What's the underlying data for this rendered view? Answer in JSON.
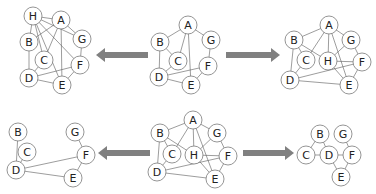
{
  "style": {
    "node_stroke": "#7a7a7a",
    "node_fill": "#ffffff",
    "edge_stroke": "#5a5a5a",
    "label_color": "#222222",
    "arrow_color": "#808080",
    "node_radius": 9
  },
  "graphs": [
    {
      "id": "top-left",
      "name": "graph-with-h-combined",
      "nodes": [
        {
          "id": "H",
          "label": "H",
          "x": 33,
          "y": 16
        },
        {
          "id": "A",
          "label": "A",
          "x": 61,
          "y": 20
        },
        {
          "id": "G",
          "label": "G",
          "x": 82,
          "y": 39
        },
        {
          "id": "B",
          "label": "B",
          "x": 29,
          "y": 42
        },
        {
          "id": "C",
          "label": "C",
          "x": 44,
          "y": 60
        },
        {
          "id": "F",
          "label": "F",
          "x": 80,
          "y": 65
        },
        {
          "id": "D",
          "label": "D",
          "x": 29,
          "y": 78
        },
        {
          "id": "E",
          "label": "E",
          "x": 62,
          "y": 85
        }
      ],
      "edges": [
        [
          "H",
          "A"
        ],
        [
          "H",
          "B"
        ],
        [
          "H",
          "G"
        ],
        [
          "H",
          "C"
        ],
        [
          "H",
          "F"
        ],
        [
          "H",
          "E"
        ],
        [
          "A",
          "G"
        ],
        [
          "A",
          "B"
        ],
        [
          "A",
          "C"
        ],
        [
          "A",
          "E"
        ],
        [
          "G",
          "F"
        ],
        [
          "B",
          "D"
        ],
        [
          "C",
          "D"
        ],
        [
          "D",
          "F"
        ],
        [
          "D",
          "E"
        ],
        [
          "F",
          "E"
        ]
      ]
    },
    {
      "id": "top-center",
      "name": "original-graph",
      "nodes": [
        {
          "id": "A",
          "label": "A",
          "x": 188,
          "y": 25
        },
        {
          "id": "G",
          "label": "G",
          "x": 211,
          "y": 40
        },
        {
          "id": "B",
          "label": "B",
          "x": 160,
          "y": 42
        },
        {
          "id": "C",
          "label": "C",
          "x": 178,
          "y": 61
        },
        {
          "id": "F",
          "label": "F",
          "x": 208,
          "y": 66
        },
        {
          "id": "D",
          "label": "D",
          "x": 159,
          "y": 77
        },
        {
          "id": "E",
          "label": "E",
          "x": 191,
          "y": 85
        }
      ],
      "edges": [
        [
          "A",
          "B"
        ],
        [
          "A",
          "G"
        ],
        [
          "A",
          "C"
        ],
        [
          "A",
          "E"
        ],
        [
          "B",
          "C"
        ],
        [
          "B",
          "D"
        ],
        [
          "C",
          "D"
        ],
        [
          "G",
          "F"
        ],
        [
          "F",
          "D"
        ],
        [
          "F",
          "E"
        ],
        [
          "D",
          "E"
        ]
      ]
    },
    {
      "id": "top-right",
      "name": "graph-with-h-added",
      "nodes": [
        {
          "id": "A",
          "label": "A",
          "x": 329,
          "y": 25
        },
        {
          "id": "B",
          "label": "B",
          "x": 294,
          "y": 40
        },
        {
          "id": "G",
          "label": "G",
          "x": 351,
          "y": 40
        },
        {
          "id": "C",
          "label": "C",
          "x": 306,
          "y": 60
        },
        {
          "id": "H",
          "label": "H",
          "x": 328,
          "y": 61
        },
        {
          "id": "F",
          "label": "F",
          "x": 362,
          "y": 62
        },
        {
          "id": "D",
          "label": "D",
          "x": 290,
          "y": 80
        },
        {
          "id": "E",
          "label": "E",
          "x": 349,
          "y": 85
        }
      ],
      "edges": [
        [
          "A",
          "B"
        ],
        [
          "A",
          "G"
        ],
        [
          "A",
          "C"
        ],
        [
          "A",
          "H"
        ],
        [
          "A",
          "E"
        ],
        [
          "B",
          "H"
        ],
        [
          "B",
          "C"
        ],
        [
          "B",
          "D"
        ],
        [
          "C",
          "D"
        ],
        [
          "G",
          "H"
        ],
        [
          "G",
          "F"
        ],
        [
          "H",
          "F"
        ],
        [
          "H",
          "E"
        ],
        [
          "F",
          "D"
        ],
        [
          "F",
          "E"
        ],
        [
          "D",
          "E"
        ]
      ]
    },
    {
      "id": "bottom-center",
      "name": "graph-with-h-source",
      "nodes": [
        {
          "id": "A",
          "label": "A",
          "x": 193,
          "y": 120
        },
        {
          "id": "B",
          "label": "B",
          "x": 160,
          "y": 133
        },
        {
          "id": "G",
          "label": "G",
          "x": 217,
          "y": 133
        },
        {
          "id": "C",
          "label": "C",
          "x": 172,
          "y": 154
        },
        {
          "id": "H",
          "label": "H",
          "x": 194,
          "y": 155
        },
        {
          "id": "F",
          "label": "F",
          "x": 228,
          "y": 156
        },
        {
          "id": "D",
          "label": "D",
          "x": 157,
          "y": 172
        },
        {
          "id": "E",
          "label": "E",
          "x": 215,
          "y": 179
        }
      ],
      "edges": [
        [
          "A",
          "B"
        ],
        [
          "A",
          "G"
        ],
        [
          "A",
          "C"
        ],
        [
          "A",
          "H"
        ],
        [
          "A",
          "E"
        ],
        [
          "B",
          "H"
        ],
        [
          "B",
          "C"
        ],
        [
          "B",
          "D"
        ],
        [
          "C",
          "D"
        ],
        [
          "G",
          "H"
        ],
        [
          "G",
          "F"
        ],
        [
          "H",
          "F"
        ],
        [
          "H",
          "E"
        ],
        [
          "F",
          "D"
        ],
        [
          "F",
          "E"
        ],
        [
          "D",
          "E"
        ]
      ]
    },
    {
      "id": "bottom-left",
      "name": "subgraph-without-a-h",
      "nodes": [
        {
          "id": "B",
          "label": "B",
          "x": 18,
          "y": 132
        },
        {
          "id": "G",
          "label": "G",
          "x": 75,
          "y": 132
        },
        {
          "id": "C",
          "label": "C",
          "x": 27,
          "y": 152
        },
        {
          "id": "F",
          "label": "F",
          "x": 86,
          "y": 155
        },
        {
          "id": "D",
          "label": "D",
          "x": 16,
          "y": 170
        },
        {
          "id": "E",
          "label": "E",
          "x": 73,
          "y": 178
        }
      ],
      "edges": [
        [
          "B",
          "D"
        ],
        [
          "C",
          "D"
        ],
        [
          "G",
          "F"
        ],
        [
          "F",
          "D"
        ],
        [
          "F",
          "E"
        ],
        [
          "D",
          "E"
        ]
      ]
    },
    {
      "id": "bottom-right",
      "name": "contracted-graph",
      "nodes": [
        {
          "id": "B",
          "label": "B",
          "x": 320,
          "y": 134
        },
        {
          "id": "G",
          "label": "G",
          "x": 343,
          "y": 134
        },
        {
          "id": "C",
          "label": "C",
          "x": 306,
          "y": 155
        },
        {
          "id": "D",
          "label": "D",
          "x": 329,
          "y": 155
        },
        {
          "id": "F",
          "label": "F",
          "x": 352,
          "y": 155
        },
        {
          "id": "E",
          "label": "E",
          "x": 341,
          "y": 177
        }
      ],
      "edges": [
        [
          "B",
          "C"
        ],
        [
          "B",
          "D"
        ],
        [
          "C",
          "D"
        ],
        [
          "D",
          "F"
        ],
        [
          "D",
          "E"
        ],
        [
          "G",
          "F"
        ],
        [
          "F",
          "E"
        ]
      ]
    }
  ],
  "arrows": [
    {
      "id": "top-left-arrow",
      "direction": "left",
      "x1": 148,
      "x2": 96,
      "y": 55
    },
    {
      "id": "top-right-arrow",
      "direction": "right",
      "x1": 226,
      "x2": 280,
      "y": 55
    },
    {
      "id": "bottom-left-arrow",
      "direction": "left",
      "x1": 150,
      "x2": 98,
      "y": 153
    },
    {
      "id": "bottom-right-arrow",
      "direction": "right",
      "x1": 243,
      "x2": 294,
      "y": 153
    }
  ]
}
